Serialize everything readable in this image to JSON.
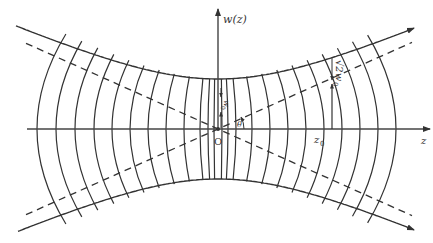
{
  "diagram": {
    "labels": {
      "y_axis": "w(z)",
      "x_axis": "z",
      "origin": "O",
      "waist": "w",
      "waist_sub": "0",
      "z0": "z",
      "z0_sub": "0",
      "angle": "θ",
      "sqrt2w0_prefix": "√2w",
      "sqrt2w0_sub": "0"
    },
    "colors": {
      "line": "#333333",
      "background": "#ffffff"
    },
    "geometry": {
      "axis_y": 129,
      "center_x": 218,
      "waist_halfwidth_px": 50,
      "z0_x": 330,
      "wavefront_x": [
        37,
        56,
        75,
        94,
        112,
        130,
        148,
        166,
        184,
        200,
        208,
        214,
        222,
        228,
        236,
        252,
        270,
        288,
        306,
        324,
        342,
        360,
        378,
        396
      ]
    }
  }
}
